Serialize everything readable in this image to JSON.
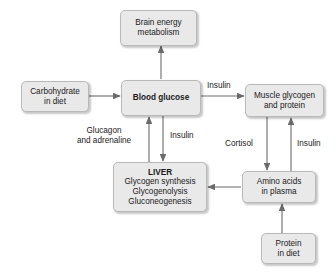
{
  "diagram": {
    "colors": {
      "node_fill": "#e9e9e9",
      "node_border": "#b9b9b9",
      "edge": "#6b6b6b",
      "text": "#1a1a1a",
      "background": "#ffffff"
    },
    "nodes": [
      {
        "id": "brain",
        "name": "brain-energy-metabolism-node",
        "lines": [
          "Brain energy",
          "metabolism"
        ],
        "bold": false
      },
      {
        "id": "carbohydrate",
        "name": "carbohydrate-in-diet-node",
        "lines": [
          "Carbohydrate",
          "in diet"
        ],
        "bold": false
      },
      {
        "id": "blood_glucose",
        "name": "blood-glucose-node",
        "lines": [
          "Blood glucose"
        ],
        "bold": true
      },
      {
        "id": "muscle",
        "name": "muscle-glycogen-and-protein-node",
        "lines": [
          "Muscle glycogen",
          "and protein"
        ],
        "bold": false
      },
      {
        "id": "liver",
        "name": "liver-node",
        "lines": [
          "LIVER",
          "Glycogen synthesis",
          "Glycogenolysis",
          "Gluconeogenesis"
        ],
        "bold_first_line": true
      },
      {
        "id": "amino_acids",
        "name": "amino-acids-in-plasma-node",
        "lines": [
          "Amino acids",
          "in plasma"
        ],
        "bold": false
      },
      {
        "id": "protein",
        "name": "protein-in-diet-node",
        "lines": [
          "Protein",
          "in diet"
        ],
        "bold": false
      }
    ],
    "edge_labels": [
      {
        "id": "insulin_muscle",
        "name": "edge-label-insulin-muscle",
        "text": "Insulin"
      },
      {
        "id": "glucagon",
        "name": "edge-label-glucagon-and-adrenaline",
        "lines": [
          "Glucagon",
          "and adrenaline"
        ]
      },
      {
        "id": "insulin_liver",
        "name": "edge-label-insulin-liver",
        "text": "Insulin"
      },
      {
        "id": "cortisol",
        "name": "edge-label-cortisol",
        "text": "Cortisol"
      },
      {
        "id": "insulin_amino",
        "name": "edge-label-insulin-amino-acids",
        "text": "Insulin"
      }
    ],
    "edges": [
      {
        "from": "blood_glucose",
        "to": "brain",
        "label": ""
      },
      {
        "from": "carbohydrate",
        "to": "blood_glucose",
        "label": ""
      },
      {
        "from": "blood_glucose",
        "to": "muscle",
        "label": "Insulin"
      },
      {
        "from": "liver",
        "to": "blood_glucose",
        "label": "Glucagon and adrenaline"
      },
      {
        "from": "blood_glucose",
        "to": "liver",
        "label": "Insulin"
      },
      {
        "from": "muscle",
        "to": "amino_acids",
        "label": "Cortisol"
      },
      {
        "from": "amino_acids",
        "to": "muscle",
        "label": "Insulin"
      },
      {
        "from": "amino_acids",
        "to": "liver",
        "label": ""
      },
      {
        "from": "protein",
        "to": "amino_acids",
        "label": ""
      }
    ]
  }
}
